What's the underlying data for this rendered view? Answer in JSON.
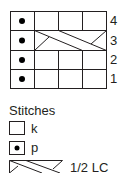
{
  "chart": {
    "rows": [
      {
        "number": "4",
        "cells": [
          "p",
          "k",
          "k",
          "k"
        ]
      },
      {
        "number": "3",
        "cells": [
          "p",
          "1/2 LC",
          "1/2 LC",
          "1/2 LC"
        ]
      },
      {
        "number": "2",
        "cells": [
          "p",
          "k",
          "k",
          "k"
        ]
      },
      {
        "number": "1",
        "cells": [
          "p",
          "k",
          "k",
          "k"
        ]
      }
    ]
  },
  "legend": {
    "title": "Stitches",
    "items": [
      {
        "symbol": "empty-square",
        "label": "k"
      },
      {
        "symbol": "dot-square",
        "label": "p"
      },
      {
        "symbol": "cable-cross",
        "label": "1/2 LC"
      }
    ]
  },
  "colors": {
    "line": "#231f20",
    "background": "#ffffff"
  }
}
